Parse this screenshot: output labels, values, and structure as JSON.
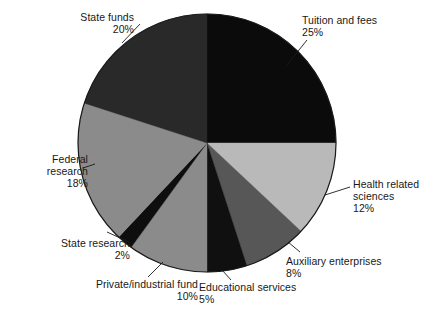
{
  "figure": {
    "background_color": "#ffffff",
    "text_color": "#181818"
  },
  "chart_data": {
    "type": "pie",
    "title": "",
    "subtitle": "",
    "xlabel": "",
    "ylabel": "",
    "legend_position": "none",
    "labels_position": "outside-with-leader-lines",
    "start_angle_deg": 0,
    "direction": "clockwise",
    "units": "percent",
    "total": 100,
    "categories": [
      "Tuition and fees",
      "Health related sciences",
      "Auxiliary enterprises",
      "Educational services",
      "Private/industrial fund",
      "State research",
      "Federal research",
      "State funds"
    ],
    "values": [
      25,
      12,
      8,
      5,
      10,
      2,
      18,
      20
    ],
    "slices": [
      {
        "name": "Tuition and fees",
        "label_line1": "Tuition and fees",
        "label_line2": "25%",
        "value": 25,
        "value_text": "25%",
        "color": "#0b0b0b",
        "align": "left"
      },
      {
        "name": "Health related sciences",
        "label_line1": "Health related",
        "label_line2": "sciences",
        "label_line3": "12%",
        "value": 12,
        "value_text": "12%",
        "color": "#b9b9b9",
        "align": "left"
      },
      {
        "name": "Auxiliary enterprises",
        "label_line1": "Auxiliary enterprises",
        "label_line2": "8%",
        "value": 8,
        "value_text": "8%",
        "color": "#575757",
        "align": "left"
      },
      {
        "name": "Educational services",
        "label_line1": "Educational services",
        "label_line2": "5%",
        "value": 5,
        "value_text": "5%",
        "color": "#101010",
        "align": "left"
      },
      {
        "name": "Private/industrial fund",
        "label_line1": "Private/industrial fund",
        "label_line2": "10%",
        "value": 10,
        "value_text": "10%",
        "color": "#8b8b8b",
        "align": "right"
      },
      {
        "name": "State research",
        "label_line1": "State research",
        "label_line2": "2%",
        "value": 2,
        "value_text": "2%",
        "color": "#0e0e0e",
        "align": "right"
      },
      {
        "name": "Federal research",
        "label_line1": "Federal",
        "label_line2": "research",
        "label_line3": "18%",
        "value": 18,
        "value_text": "18%",
        "color": "#8b8b8b",
        "align": "right"
      },
      {
        "name": "State funds",
        "label_line1": "State funds",
        "label_line2": "20%",
        "value": 20,
        "value_text": "20%",
        "color": "#292929",
        "align": "right"
      }
    ],
    "geometry": {
      "center_x": 207,
      "center_y": 143,
      "radius": 129,
      "outline_color": "#1a1a1a"
    }
  },
  "labels": {
    "tuition": "Tuition and fees\n25%",
    "health": "Health related\nsciences\n12%",
    "auxiliary": "Auxiliary enterprises\n8%",
    "educational": "Educational services\n5%",
    "private": "Private/industrial fund\n10%",
    "state_research": "State research\n2%",
    "federal": "Federal\nresearch\n18%",
    "state_funds": "State funds\n20%"
  }
}
